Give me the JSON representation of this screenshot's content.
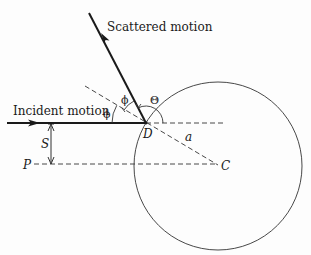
{
  "diagram": {
    "labels": {
      "scattered": "Scattered motion",
      "incident": "Incident motion",
      "phi_1": "ϕ",
      "phi_2": "ϕ",
      "theta": "Θ",
      "point_d": "D",
      "point_c": "C",
      "point_p": "P",
      "impact_s": "S",
      "radius_a": "a"
    },
    "geometry": {
      "circle": {
        "cx": 218,
        "cy": 166,
        "r": 84
      },
      "point_D": [
        146,
        123
      ],
      "point_C": [
        219,
        166
      ],
      "incident_line": {
        "from": [
          7,
          123
        ],
        "to": [
          146,
          123
        ]
      },
      "scattered_line": {
        "from": [
          146,
          123
        ],
        "to": [
          89,
          13
        ]
      },
      "reference_horizontal": {
        "from": [
          146,
          123
        ],
        "to": [
          225,
          123
        ]
      },
      "p_line": {
        "from": [
          34,
          164
        ],
        "to": [
          219,
          164
        ]
      },
      "normal_line": {
        "from": [
          85,
          86
        ],
        "to": [
          219,
          166
        ]
      }
    },
    "colors": {
      "line": "#1a1a1a",
      "background": "#fdfdfd"
    }
  }
}
